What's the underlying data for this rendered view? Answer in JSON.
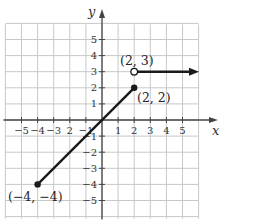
{
  "chart_data": {
    "type": "line",
    "title": "",
    "xlabel": "x",
    "ylabel": "y",
    "xlim": [
      -6,
      6
    ],
    "ylim": [
      -6,
      6
    ],
    "grid": true,
    "x_ticks": [
      -5,
      -4,
      -3,
      -2,
      -1,
      1,
      2,
      3,
      4,
      5
    ],
    "y_ticks": [
      5,
      4,
      3,
      2,
      1,
      -1,
      -2,
      -3,
      -4,
      -5
    ],
    "x_tick_labels": [
      "−5",
      "−4",
      "−3",
      "2",
      "−1",
      "1",
      "2",
      "3",
      "4",
      "5"
    ],
    "y_tick_labels": [
      "5",
      "4",
      "3",
      "2",
      "1",
      "1",
      "2",
      "3",
      "4",
      "5"
    ],
    "series": [
      {
        "name": "segment",
        "type": "line",
        "points": [
          [
            -4,
            -4
          ],
          [
            2,
            2
          ]
        ],
        "start_marker": "closed",
        "end_marker": "closed"
      },
      {
        "name": "ray",
        "type": "ray",
        "points": [
          [
            2,
            3
          ],
          [
            5.9,
            3
          ]
        ],
        "start_marker": "open",
        "end_marker": "arrow"
      }
    ],
    "annotations": [
      {
        "text": "(2, 3)",
        "x": 2,
        "y": 3
      },
      {
        "text": "(2, 2)",
        "x": 2,
        "y": 2
      },
      {
        "text": "(−4, −4)",
        "x": -4,
        "y": -4
      }
    ]
  },
  "labels": {
    "x_axis": "x",
    "y_axis": "y",
    "pt_open": "(2, 3)",
    "pt_closed_top": "(2, 2)",
    "pt_closed_bottom": "(−4, −4)"
  }
}
